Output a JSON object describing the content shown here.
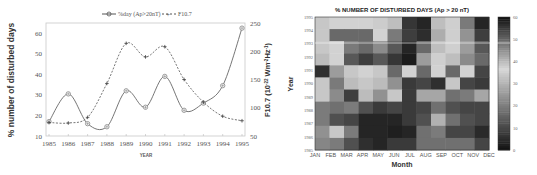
{
  "chart_data": [
    {
      "type": "line",
      "title": "",
      "xlabel": "YEAR",
      "ylabel": "% number of disturbed days",
      "y2label": "F10.7 (10^-22 Wm^-2Hz^-1)",
      "x": [
        1985,
        1986,
        1987,
        1988,
        1989,
        1990,
        1991,
        1992,
        1993,
        1994,
        1995
      ],
      "xticks": [
        "1985",
        "1986",
        "1987",
        "1988",
        "1989",
        "1990",
        "1991",
        "1992",
        "1993",
        "1994",
        "1995"
      ],
      "ylim": [
        10,
        65
      ],
      "yticks": [
        10,
        20,
        30,
        40,
        50,
        60
      ],
      "y2lim": [
        50,
        250
      ],
      "y2ticks": [
        50,
        100,
        150,
        200,
        250
      ],
      "legend_position": "top",
      "grid": false,
      "series": [
        {
          "name": "%day (Ap>20nT)",
          "axis": "left",
          "style": "solid",
          "marker": "circle-plus",
          "values": [
            17,
            30.5,
            16,
            14.5,
            32,
            24,
            39,
            22.5,
            26,
            34.5,
            62.5
          ]
        },
        {
          "name": "F10.7",
          "axis": "right",
          "style": "dashed",
          "marker": "plus",
          "values": [
            74,
            73,
            83,
            143,
            214,
            190,
            208,
            150,
            110,
            85,
            77
          ]
        }
      ]
    },
    {
      "type": "heatmap",
      "title": "% NUMBER OF DISTURBED DAYS (Ap > 20 nT)",
      "xlabel": "Month",
      "ylabel": "Year",
      "categories": [
        "JAN",
        "FEB",
        "MAR",
        "APR",
        "MAY",
        "JUN",
        "JUL",
        "AUG",
        "SEP",
        "OCT",
        "NOV",
        "DEC"
      ],
      "years": [
        "1995",
        "1994",
        "1993",
        "1992",
        "1991",
        "1990",
        "1989",
        "1988",
        "1987",
        "1986",
        "1985"
      ],
      "colorbar": {
        "min": 0,
        "max": 60,
        "ticks": [
          0,
          10,
          20,
          30,
          40,
          50,
          60
        ]
      },
      "values": [
        [
          34,
          36,
          36,
          36,
          35,
          40,
          56,
          58,
          40,
          38,
          48,
          58
        ],
        [
          34,
          50,
          50,
          50,
          36,
          48,
          55,
          57,
          42,
          38,
          45,
          55
        ],
        [
          34,
          36,
          48,
          50,
          46,
          52,
          58,
          50,
          40,
          38,
          44,
          52
        ],
        [
          32,
          36,
          52,
          55,
          52,
          56,
          59,
          44,
          38,
          40,
          46,
          50
        ],
        [
          6,
          26,
          34,
          36,
          34,
          50,
          36,
          50,
          36,
          50,
          36,
          10
        ],
        [
          34,
          48,
          32,
          34,
          32,
          24,
          8,
          10,
          6,
          34,
          10,
          8
        ],
        [
          34,
          46,
          55,
          32,
          24,
          34,
          8,
          28,
          28,
          18,
          20,
          28
        ],
        [
          20,
          18,
          20,
          12,
          8,
          10,
          8,
          10,
          18,
          12,
          10,
          10
        ],
        [
          20,
          12,
          10,
          4,
          4,
          4,
          8,
          12,
          30,
          18,
          12,
          10
        ],
        [
          24,
          34,
          20,
          4,
          4,
          3,
          4,
          18,
          20,
          10,
          10,
          5
        ],
        [
          22,
          20,
          12,
          6,
          4,
          8,
          8,
          18,
          18,
          18,
          18,
          10
        ]
      ]
    }
  ],
  "left_chart": {
    "legend": {
      "item1": "%day (Ap>20nT)",
      "item2": "F10.7"
    },
    "ylabel": "% number of disturbed days",
    "y2label_main": "F10.7 (10",
    "y2label_exp1": "-22",
    "y2label_mid": " Wm",
    "y2label_exp2": "-2",
    "y2label_hz": "Hz",
    "y2label_exp3": "-1",
    "y2label_end": ")",
    "xlabel": "YEAR"
  },
  "right_chart": {
    "title": "% NUMBER OF DISTURBED DAYS (Ap > 20 nT)",
    "xlabel": "Month",
    "ylabel": "Year"
  }
}
